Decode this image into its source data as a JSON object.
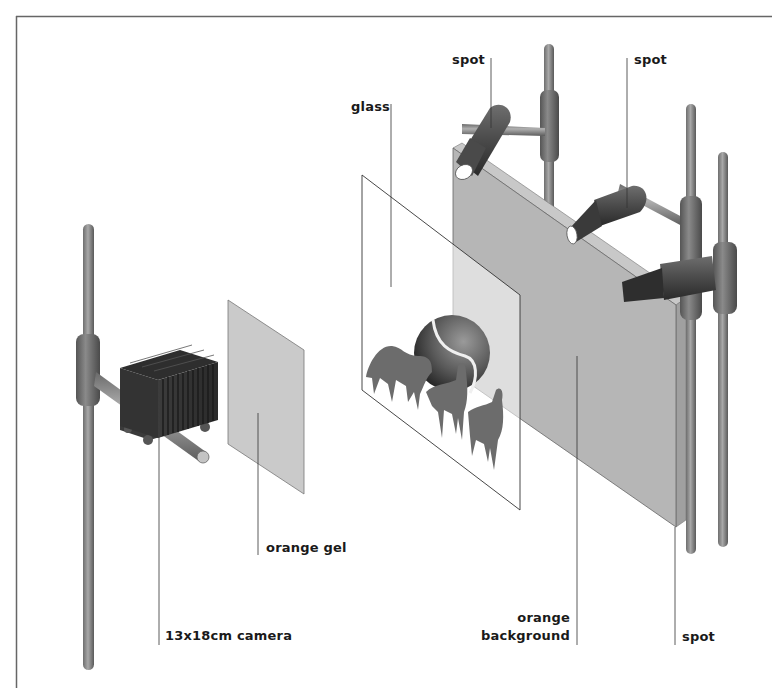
{
  "diagram": {
    "labels": {
      "glass": "glass",
      "spot_top_left": "spot",
      "spot_top_right": "spot",
      "orange_gel": "orange gel",
      "camera": "13x18cm camera",
      "orange_background_line1": "orange",
      "orange_background_line2": "background",
      "spot_bottom": "spot"
    },
    "components": [
      "13x18cm camera",
      "orange gel",
      "glass",
      "orange background",
      "spot",
      "spot",
      "spot"
    ],
    "colors": {
      "line": "#333333",
      "panel": "#b5b5b5",
      "panel_edge": "#9a9a9a",
      "gel": "#cccccc",
      "metal_dark": "#5a5a5a",
      "metal_mid": "#8a8a8a",
      "metal_light": "#b8b8b8"
    }
  }
}
